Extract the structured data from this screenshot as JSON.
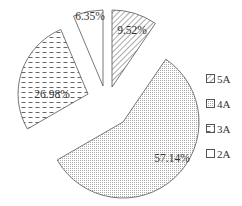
{
  "chart_data": {
    "type": "pie",
    "title": "",
    "exploded": true,
    "categories": [
      "5A",
      "4A",
      "3A",
      "2A"
    ],
    "values": [
      9.52,
      57.14,
      26.98,
      6.35
    ],
    "labels": [
      "9.52%",
      "57.14%",
      "26.98%",
      "6.35%"
    ],
    "patterns": [
      "diagonal-hatch",
      "dots",
      "horizontal-dashes",
      "blank"
    ],
    "start_angle": "12 o'clock",
    "direction": "clockwise",
    "legend": {
      "position": "right",
      "entries": [
        "5A",
        "4A",
        "3A",
        "2A"
      ]
    }
  },
  "colors": {
    "stroke": "#555555",
    "fill": "#ffffff",
    "pattern": "#666666",
    "text": "#333333"
  }
}
